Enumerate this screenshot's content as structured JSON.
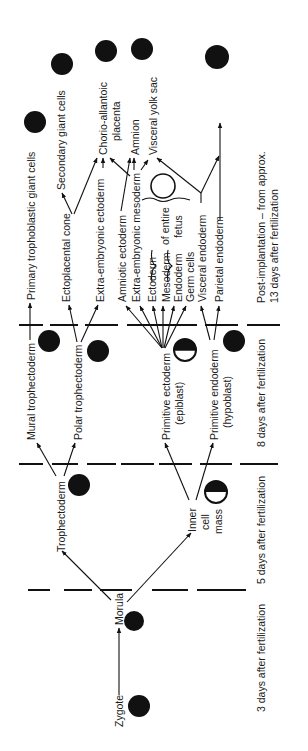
{
  "diagram": {
    "colors": {
      "ink": "#111111",
      "background": "#ffffff"
    },
    "stages": [
      {
        "id": "day3",
        "label": "3 days after fertilization"
      },
      {
        "id": "day5",
        "label": "5 days after fertilization"
      },
      {
        "id": "day8",
        "label": "8 days after fertilization"
      },
      {
        "id": "post",
        "line1": "Post-implantation – from approx.",
        "line2": "13 days after fertilization"
      }
    ],
    "nodes": {
      "zygote": "Zygote",
      "morula": "Morula",
      "trophectoderm": "Trophectoderm",
      "inner_cell_mass": {
        "line1": "Inner",
        "line2": "cell",
        "line3": "mass"
      },
      "mural_trophectoderm": "Mural trophectoderm",
      "polar_trophectoderm": "Polar trophectoderm",
      "primitive_ectoderm": {
        "line1": "Primitive ectoderm",
        "line2": "(epiblast)"
      },
      "primitive_endoderm": {
        "line1": "Primitive endoderm",
        "line2": "(hypoblast)"
      },
      "primary_trophoblastic_giant_cells": "Primary trophoblastic giant cells",
      "ectoplacental_cone": "Ectoplacental cone",
      "secondary_giant_cells": "Secondary giant cells",
      "extra_embryonic_ectoderm": "Extra-embryonic ectoderm",
      "chorio_allantoic_placenta": {
        "line1": "Chorio-allantoic",
        "line2": "placenta"
      },
      "amniotic_ectoderm": "Amniotic ectoderm",
      "amnion": "Amnion",
      "extra_embryonic_mesoderm": "Extra-embryonic mesoderm",
      "visceral_yolk_sac": "Visceral yolk sac",
      "ectoderm": "Ectoderm",
      "mesoderm": "Mesoderm",
      "endoderm": "Endoderm",
      "of_entire_fetus": {
        "line1": "of entire",
        "line2": "fetus"
      },
      "germ_cells": "Germ cells",
      "visceral_endoderm": "Visceral endoderm",
      "parietal_endoderm": "Parietal endoderm"
    },
    "icons": [
      "solid-cell-icon",
      "half-filled-cell-icon",
      "ring-fetus-icon"
    ]
  }
}
